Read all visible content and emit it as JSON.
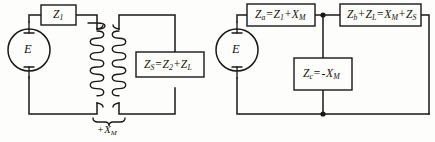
{
  "figure": {
    "type": "circuit-diagram",
    "stroke_color": "#1a1814",
    "background_color": "#fdfdfb",
    "width": 435,
    "height": 142
  },
  "left_circuit": {
    "name": "coupled-transformer-circuit",
    "source": {
      "label": "E",
      "symbol": "ac-voltage-source"
    },
    "components": [
      {
        "id": "z1",
        "label": "Z₁",
        "label_plain": "Z1",
        "shape": "rectangle",
        "position": "top-primary-branch"
      },
      {
        "id": "zs",
        "label": "Zₛ = Z₂ + Zₗ",
        "label_plain": "ZS = Z2 + ZL",
        "shape": "rectangle",
        "position": "secondary-branch"
      }
    ],
    "transformer": {
      "symbol": "air-core-transformer",
      "primary_winding": "coil",
      "secondary_winding": "coil",
      "coupling_label": "+Xₘ",
      "coupling_label_plain": "+XM",
      "brace": "under-brace"
    }
  },
  "right_circuit": {
    "name": "equivalent-t-network",
    "source": {
      "label": "E",
      "symbol": "ac-voltage-source"
    },
    "components": [
      {
        "id": "za",
        "label": "Zₐ = Z₁ + Xₘ",
        "label_plain": "Za = Z1 + XM",
        "shape": "rectangle",
        "position": "top-left-series-arm"
      },
      {
        "id": "zb",
        "label": "Zᵇ + Zₗ = Xₘ + Zₛ",
        "label_plain": "Zb + ZL = XM + ZS",
        "shape": "rectangle",
        "position": "top-right-series-arm"
      },
      {
        "id": "zc",
        "label": "Zᶜ = -Xₘ",
        "label_plain": "Zc = -XM",
        "shape": "rectangle",
        "position": "shunt-arm"
      }
    ],
    "junctions": [
      {
        "id": "top-node",
        "type": "connection-dot"
      },
      {
        "id": "bottom-node",
        "type": "connection-dot"
      }
    ]
  },
  "labels": {
    "z1": {
      "base": "Z",
      "sub": "1"
    },
    "zs": {
      "p1": "Z",
      "s1": "S",
      "op1": "=",
      "p2": "Z",
      "s2": "2",
      "op2": "+",
      "p3": "Z",
      "s3": "L"
    },
    "xm_brace": {
      "op": "+",
      "base": "X",
      "sub": "M"
    },
    "za": {
      "p1": "Z",
      "s1": "a",
      "op1": "=",
      "p2": "Z",
      "s2": "1",
      "op2": "+",
      "p3": "X",
      "s3": "M"
    },
    "zb": {
      "p1": "Z",
      "s1": "b",
      "op1": "+",
      "p2": "Z",
      "s2": "L",
      "op2": "=",
      "p3": "X",
      "s3": "M",
      "op3": "+",
      "p4": "Z",
      "s4": "S"
    },
    "zc": {
      "p1": "Z",
      "s1": "c",
      "op1": "=",
      "op2": "-",
      "p2": "X",
      "s2": "M"
    },
    "source_left": "E",
    "source_right": "E"
  }
}
